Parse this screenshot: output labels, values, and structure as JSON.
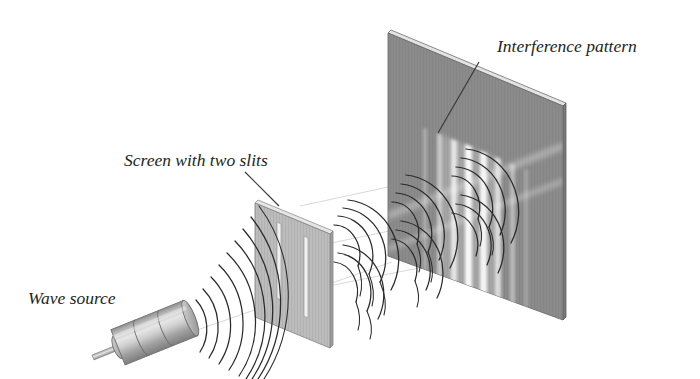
{
  "figure": {
    "background_color": "#ffffff"
  },
  "labels": {
    "wave_source": "Wave source",
    "screen_with_two_slits": "Screen with two slits",
    "interference_pattern": "Interference pattern"
  },
  "colors": {
    "far_screen_face": "#8b8b8b",
    "far_screen_edge": "#6a6a6a",
    "far_screen_top": "#d9d9d9",
    "slit_screen_face": "#b9b9b9",
    "slit_screen_edge": "#9a9a9a",
    "slit_screen_top": "#dedede",
    "slit_fill": "#efefef",
    "source_body": "#c9c9c9",
    "source_shade": "#9e9e9e",
    "wave_stroke": "#2b2b2b",
    "leader_stroke": "#3a3a3a",
    "fringe_bright": "#f2f2f2",
    "text": "#231f20"
  },
  "far_screen": {
    "name": "detection-screen",
    "corners": [
      [
        388,
        33
      ],
      [
        563,
        106
      ],
      [
        563,
        320
      ],
      [
        388,
        256
      ]
    ]
  },
  "slit_screen": {
    "name": "barrier-with-two-slits",
    "corners": [
      [
        255,
        203
      ],
      [
        330,
        234
      ],
      [
        330,
        348
      ],
      [
        255,
        317
      ]
    ],
    "slit_count": 2,
    "slits": [
      {
        "x_frac": 0.33,
        "top_frac": 0.23,
        "bottom_frac": 0.82
      },
      {
        "x_frac": 0.66,
        "top_frac": 0.28,
        "bottom_frac": 0.87
      }
    ]
  },
  "source": {
    "name": "wave-source-emitter",
    "segments": 3,
    "rod_tip": [
      96,
      352
    ],
    "body_center": [
      155,
      331
    ],
    "angle_deg": -22
  },
  "incident_waves": {
    "description": "Concentric circular wavefronts emitted by the source toward the slit barrier",
    "center": [
      168,
      322
    ],
    "arc_count": 8,
    "radii": [
      34,
      48,
      62,
      76,
      90,
      104,
      118,
      132
    ]
  },
  "diffracted_waves": {
    "description": "Circular wavefronts spreading out from each of the two slits",
    "wavelet_groups": 3,
    "arcs_per_group": 4
  },
  "fringes": {
    "description": "Bright interference maxima visible on the detection screen",
    "count": 8,
    "intensities": [
      0.3,
      0.55,
      0.8,
      1.0,
      0.95,
      0.7,
      0.45,
      0.25
    ]
  },
  "leaders": {
    "slit_screen_leader": [
      [
        245,
        172
      ],
      [
        278,
        205
      ]
    ],
    "pattern_leader": [
      [
        478,
        62
      ],
      [
        438,
        133
      ]
    ]
  }
}
